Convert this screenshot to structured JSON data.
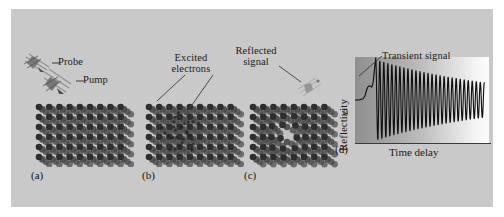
{
  "figure": {
    "background_color": "#c9c9c9",
    "panels": [
      {
        "id": "a",
        "label": "(a)"
      },
      {
        "id": "b",
        "label": "(b)"
      },
      {
        "id": "c",
        "label": "(c)"
      },
      {
        "id": "d",
        "label": "(d)"
      }
    ],
    "annotations": {
      "probe": "Probe",
      "pump": "Pump",
      "excited_line1": "Excited",
      "excited_line2": "electrons",
      "reflected_line1": "Reflected",
      "reflected_line2": "signal",
      "transient": "Transient signal"
    },
    "icons": {
      "probe_beam": "probe-beam-icon",
      "pump_beam": "pump-beam-icon",
      "reflected_beam": "reflected-beam-icon",
      "lattice_a": "atomic-lattice-icon",
      "lattice_b": "atomic-lattice-excited-icon",
      "lattice_c": "atomic-lattice-deformed-icon"
    },
    "colors": {
      "panel_bg": "#c9c9c9",
      "atom": "#4a4a4a",
      "atom_dark": "#2e2e2e",
      "text": "#1c1c1c",
      "trace": "#111111",
      "plot_left": "#8f8f8f",
      "plot_right": "#fdfdfd"
    }
  },
  "chart_data": {
    "type": "line",
    "title": "",
    "xlabel": "Time delay",
    "ylabel": "Reflectivity",
    "ytick_labels": [
      "0"
    ],
    "annotations": [
      {
        "text": "Transient signal",
        "target_x": 0.155,
        "target_y": 0.88
      }
    ],
    "grid": false,
    "legend": null,
    "xlim": [
      0,
      1
    ],
    "ylim": [
      -1,
      1
    ],
    "series": [
      {
        "name": "Transient reflectivity",
        "x": [
          0.0,
          0.02,
          0.04,
          0.06,
          0.075,
          0.085,
          0.095,
          0.105,
          0.115,
          0.125,
          0.135,
          0.145,
          0.155,
          0.16,
          0.165,
          0.17,
          0.175,
          0.18,
          0.185,
          0.19,
          0.195,
          0.2
        ],
        "y": [
          0.0,
          0.0,
          0.01,
          0.03,
          0.1,
          0.22,
          0.3,
          0.33,
          0.32,
          0.3,
          0.4,
          0.7,
          0.98,
          0.55,
          -0.1,
          -0.62,
          -0.86,
          -0.4,
          0.3,
          0.74,
          0.2,
          -0.55
        ]
      }
    ],
    "oscillation": {
      "start_x": 0.155,
      "end_x": 0.965,
      "cycles": 27,
      "amplitude_start": 0.93,
      "amplitude_end": 0.4,
      "decay": "exponential",
      "baseline_y": 0.0
    },
    "baseline": {
      "from_x": 0.0,
      "to_x": 0.075,
      "y": 0.0
    },
    "transient_peak": {
      "x": 0.105,
      "y": 0.33
    }
  }
}
